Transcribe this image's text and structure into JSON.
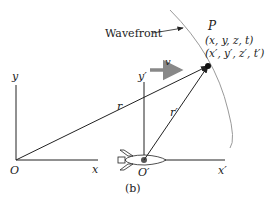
{
  "diagram": {
    "caption": "(b)",
    "wavefront_label": "Wavefront",
    "point": {
      "name": "P",
      "coords_unprimed": "(x, y, z, t)",
      "coords_primed": "(x′, y′, z′, t′)"
    },
    "frame_S": {
      "origin": "O",
      "x_axis": "x",
      "y_axis": "y",
      "vector": "r"
    },
    "frame_S_prime": {
      "origin": "O′",
      "x_axis": "x′",
      "y_axis": "y′",
      "vector": "r′"
    },
    "velocity_label": "v",
    "colors": {
      "line": "#222222",
      "wavefront": "#9a9a9a",
      "velocity_arrow": "#888888"
    }
  }
}
